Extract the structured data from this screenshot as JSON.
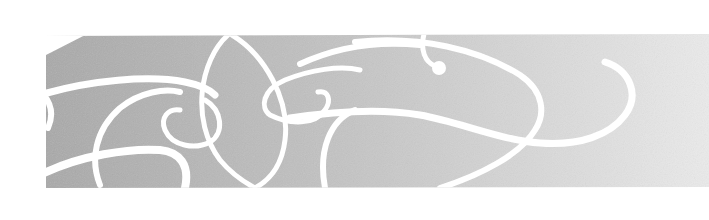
{
  "banner": {
    "type": "decorative-swirl-banner",
    "colors": {
      "background": "#ffffff",
      "band_left": "#a9a9a9",
      "band_right": "#ebebeb",
      "flourish": "#ffffff"
    }
  }
}
